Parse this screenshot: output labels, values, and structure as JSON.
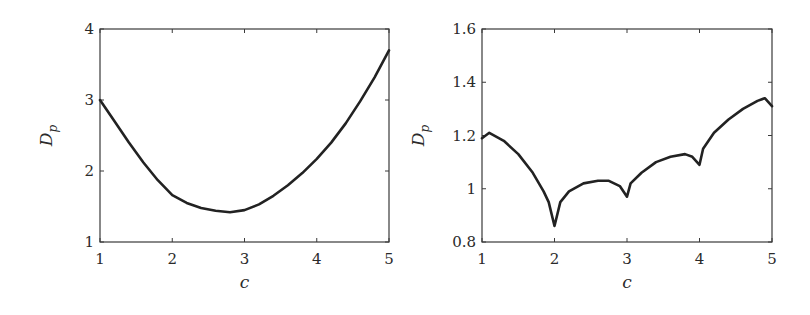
{
  "chart_data": [
    {
      "type": "line",
      "title": "",
      "xlabel": "c",
      "ylabel": "D_p",
      "ylabel_main": "D",
      "ylabel_sub": "p",
      "xlim": [
        1,
        5
      ],
      "ylim": [
        1,
        4
      ],
      "xticks": [
        "1",
        "2",
        "3",
        "4",
        "5"
      ],
      "yticks": [
        "1",
        "2",
        "3",
        "4"
      ],
      "grid": false,
      "frame": {
        "x0": 100,
        "x1": 389,
        "y0": 29,
        "y1": 242
      },
      "x": [
        1.0,
        1.2,
        1.4,
        1.6,
        1.8,
        2.0,
        2.2,
        2.4,
        2.6,
        2.8,
        3.0,
        3.2,
        3.4,
        3.6,
        3.8,
        4.0,
        4.2,
        4.4,
        4.6,
        4.8,
        5.0
      ],
      "values": [
        3.0,
        2.7,
        2.4,
        2.12,
        1.87,
        1.66,
        1.55,
        1.48,
        1.44,
        1.42,
        1.45,
        1.53,
        1.65,
        1.8,
        1.97,
        2.17,
        2.4,
        2.67,
        2.98,
        3.32,
        3.7
      ]
    },
    {
      "type": "line",
      "title": "",
      "xlabel": "c",
      "ylabel": "D_p",
      "ylabel_main": "D",
      "ylabel_sub": "p",
      "xlim": [
        1,
        5
      ],
      "ylim": [
        0.8,
        1.6
      ],
      "xticks": [
        "1",
        "2",
        "3",
        "4",
        "5"
      ],
      "yticks": [
        "0.8",
        "1",
        "1.2",
        "1.4",
        "1.6"
      ],
      "grid": false,
      "frame": {
        "x0": 482,
        "x1": 772,
        "y0": 29,
        "y1": 242
      },
      "x": [
        1.0,
        1.1,
        1.3,
        1.5,
        1.7,
        1.85,
        1.92,
        2.0,
        2.08,
        2.2,
        2.4,
        2.6,
        2.75,
        2.9,
        3.0,
        3.05,
        3.2,
        3.4,
        3.6,
        3.8,
        3.9,
        4.0,
        4.05,
        4.2,
        4.4,
        4.6,
        4.8,
        4.9,
        5.0
      ],
      "values": [
        1.19,
        1.21,
        1.18,
        1.13,
        1.06,
        0.99,
        0.95,
        0.86,
        0.95,
        0.99,
        1.02,
        1.03,
        1.03,
        1.01,
        0.97,
        1.02,
        1.06,
        1.1,
        1.12,
        1.13,
        1.12,
        1.09,
        1.15,
        1.21,
        1.26,
        1.3,
        1.33,
        1.34,
        1.31
      ]
    }
  ]
}
